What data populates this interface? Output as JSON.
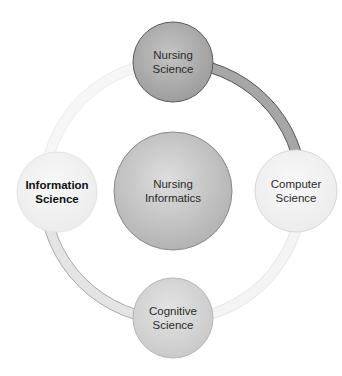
{
  "diagram": {
    "center": {
      "title": "Nursing Informatics",
      "line1": "Nursing",
      "line2": "Informatics",
      "cx": 173,
      "cy": 191,
      "r": 59,
      "fill": "#b8b8b8",
      "stroke": "#8a8a8a"
    },
    "nodes": [
      {
        "id": "nursing-science",
        "line1": "Nursing",
        "line2": "Science",
        "cx": 173,
        "cy": 62,
        "r": 40,
        "fill": "#a9a9a9",
        "stroke": "#5a5a5a",
        "bold": false
      },
      {
        "id": "computer-science",
        "line1": "Computer",
        "line2": "Science",
        "cx": 296,
        "cy": 191,
        "r": 41,
        "fill": "#ececec",
        "stroke": "#d8d8d8",
        "bold": false
      },
      {
        "id": "cognitive-science",
        "line1": "Cognitive",
        "line2": "Science",
        "cx": 173,
        "cy": 318,
        "r": 40,
        "fill": "#d2d2d2",
        "stroke": "#b5b5b5",
        "bold": false
      },
      {
        "id": "information-science",
        "line1": "Information",
        "line2": "Science",
        "cx": 57,
        "cy": 192,
        "r": 40,
        "fill": "#f3f3f3",
        "stroke": "#e4e4e4",
        "bold": true
      }
    ],
    "ring": {
      "cx": 173,
      "cy": 191,
      "r": 129,
      "width": 10,
      "arcs": [
        {
          "id": "nursing-to-computer",
          "from_deg": -90,
          "to_deg": 0,
          "fill": "#a6a6a6",
          "stroke": "#555555"
        },
        {
          "id": "computer-to-cognitive",
          "from_deg": 0,
          "to_deg": 90,
          "fill": "#f4f4f4",
          "stroke": "#e6e6e6"
        },
        {
          "id": "cognitive-to-information",
          "from_deg": 90,
          "to_deg": 180,
          "fill": "#e4e4e4",
          "stroke": "#a8a8a8"
        },
        {
          "id": "information-to-nursing",
          "from_deg": 180,
          "to_deg": 270,
          "fill": "#f6f6f6",
          "stroke": "#ececec"
        }
      ]
    }
  }
}
